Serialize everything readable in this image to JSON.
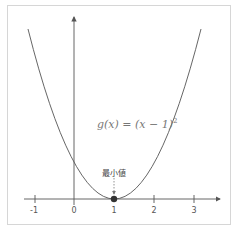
{
  "diagram": {
    "function_label": "g(x) = (x − 1)",
    "function_exponent": "2",
    "minimum_label": "最小値",
    "x_ticks": [
      "-1",
      "0",
      "1",
      "2",
      "3"
    ],
    "minimum_point": {
      "x": 1,
      "y": 0
    },
    "colors": {
      "curve": "#555555",
      "axis": "#555555",
      "point": "#333333",
      "frame": "#d6d6d6"
    }
  }
}
